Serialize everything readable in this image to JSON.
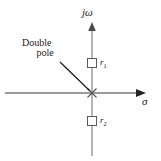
{
  "figure": {
    "type": "pole-zero-plot",
    "title": "",
    "background_color": "#ffffff",
    "stroke_color": "#3a3a3a",
    "text_color": "#1a1a1a"
  },
  "axes": {
    "vertical": {
      "label": "jω",
      "name": "imaginary-axis",
      "arrow": "up"
    },
    "horizontal": {
      "label": "σ",
      "name": "real-axis",
      "arrow": "right"
    },
    "origin": {
      "x": 92,
      "y": 93
    }
  },
  "annotation": {
    "line1": "Double",
    "line2": "pole",
    "leader": {
      "from_x": 60,
      "from_y": 62,
      "to_x": 90,
      "to_y": 91
    }
  },
  "markers": [
    {
      "name": "pole-marker",
      "glyph": "×",
      "label": "",
      "position": {
        "x": 92,
        "y": 93
      },
      "shape": "cross",
      "description": "double pole at origin"
    },
    {
      "name": "residue-marker-r1",
      "glyph": "□",
      "label": "r",
      "subscript": "1",
      "position": {
        "x": 92,
        "y": 63
      },
      "shape": "square"
    },
    {
      "name": "residue-marker-r2",
      "glyph": "□",
      "label": "r",
      "subscript": "2",
      "position": {
        "x": 92,
        "y": 121
      },
      "shape": "square"
    }
  ]
}
